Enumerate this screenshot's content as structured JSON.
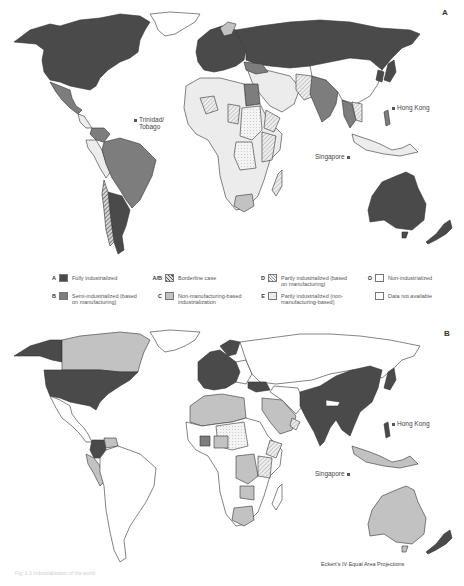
{
  "figure": {
    "panels": [
      {
        "id": "A",
        "letter": "A",
        "labels": {
          "trinidad": "Trinidad/\nTobago",
          "trinidad_line1": "Trinidad/",
          "trinidad_line2": "Tobago",
          "hong_kong": "Hong Kong",
          "singapore": "Singapore"
        },
        "regions": [
          {
            "name": "North America (USA, Canada)",
            "category": "A"
          },
          {
            "name": "Mexico",
            "category": "B"
          },
          {
            "name": "Brazil",
            "category": "B"
          },
          {
            "name": "Argentina",
            "category": "A"
          },
          {
            "name": "Europe",
            "category": "A"
          },
          {
            "name": "USSR",
            "category": "A"
          },
          {
            "name": "Egypt",
            "category": "B"
          },
          {
            "name": "India",
            "category": "B"
          },
          {
            "name": "Japan",
            "category": "A"
          },
          {
            "name": "Australia",
            "category": "A"
          },
          {
            "name": "New Zealand",
            "category": "A"
          },
          {
            "name": "China",
            "category": "O"
          },
          {
            "name": "South Africa",
            "category": "C"
          }
        ]
      },
      {
        "id": "B",
        "letter": "B",
        "labels": {
          "hong_kong": "Hong Kong",
          "singapore": "Singapore",
          "projection": "Eckert's IV Equal Area Projections"
        },
        "regions": [
          {
            "name": "USA",
            "category": "A"
          },
          {
            "name": "Canada",
            "category": "C"
          },
          {
            "name": "Alaska",
            "category": "A"
          },
          {
            "name": "Colombia/Venezuela",
            "category": "A"
          },
          {
            "name": "Peru/Ecuador",
            "category": "C"
          },
          {
            "name": "Western Europe",
            "category": "A"
          },
          {
            "name": "China / India / SE Asia",
            "category": "A"
          },
          {
            "name": "Japan",
            "category": "A"
          },
          {
            "name": "Turkey",
            "category": "A"
          },
          {
            "name": "Saudi Arabia",
            "category": "C"
          },
          {
            "name": "North Africa",
            "category": "C"
          },
          {
            "name": "Australia",
            "category": "C"
          },
          {
            "name": "New Zealand",
            "category": "A"
          },
          {
            "name": "USSR",
            "category": "O"
          }
        ]
      }
    ],
    "legend": {
      "items": [
        {
          "code": "A",
          "label": "Fully industrialized",
          "pattern": "dark",
          "color": "#4a4a4a"
        },
        {
          "code": "B",
          "label": "Semi-industrialized (based on manufacturing)",
          "pattern": "medium",
          "color": "#7d7d7d"
        },
        {
          "code": "A/B",
          "label": "Borderline case",
          "pattern": "dark-hatch",
          "color": "#6a6a6a"
        },
        {
          "code": "C",
          "label": "Non-manufacturing-based industrialization",
          "pattern": "light",
          "color": "#c2c2c2"
        },
        {
          "code": "D",
          "label": "Partly industrialized (based on manufacturing)",
          "pattern": "light-hatch",
          "color": "#b5b5b5"
        },
        {
          "code": "E",
          "label": "Partly industrialized (non-manufacturing-based)",
          "pattern": "very-light",
          "color": "#ececec"
        },
        {
          "code": "O",
          "label": "Non-industrialized",
          "pattern": "white",
          "color": "#ffffff"
        },
        {
          "code": "",
          "label": "Data not available",
          "pattern": "white",
          "color": "#ffffff"
        }
      ]
    },
    "caption": "Fig. 1.3 Industrialization of the world"
  },
  "colors": {
    "A": "#4a4a4a",
    "B": "#7d7d7d",
    "C": "#c2c2c2",
    "E": "#ececec",
    "O": "#ffffff",
    "stroke": "#333333"
  }
}
